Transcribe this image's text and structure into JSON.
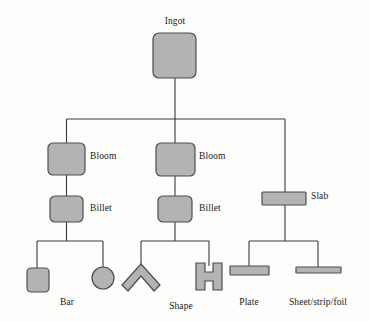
{
  "diagram": {
    "title": "Ingot",
    "type": "process-flow-tree",
    "colors": {
      "shape_fill": "#b3b3b3",
      "shape_stroke": "#4d4d4d",
      "line": "#3a3a3a",
      "background": "#fdfdfb",
      "text": "#1a1a1a"
    },
    "nodes": {
      "ingot": {
        "label": "Ingot",
        "shape": "rounded-square"
      },
      "bloom_left": {
        "label": "Bloom",
        "shape": "rounded-square"
      },
      "billet_left": {
        "label": "Billet",
        "shape": "rounded-square"
      },
      "bloom_mid": {
        "label": "Bloom",
        "shape": "rounded-square"
      },
      "billet_mid": {
        "label": "Billet",
        "shape": "rounded-square"
      },
      "slab": {
        "label": "Slab",
        "shape": "flat-rectangle"
      }
    },
    "products": [
      {
        "key": "bar",
        "label": "Bar",
        "forms": [
          "square-bar",
          "round-bar"
        ]
      },
      {
        "key": "shape",
        "label": "Shape",
        "forms": [
          "angle",
          "h-beam"
        ]
      },
      {
        "key": "plate",
        "label": "Plate",
        "forms": [
          "thick-flat"
        ]
      },
      {
        "key": "sheet",
        "label": "Sheet/strip/foil",
        "forms": [
          "thin-flat"
        ]
      }
    ]
  }
}
